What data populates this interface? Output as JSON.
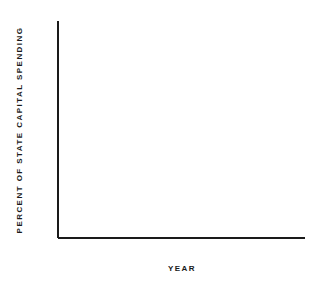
{
  "chart_data": {
    "type": "line",
    "title": "",
    "xlabel": "YEAR",
    "ylabel": "PERCENT OF STATE CAPITAL SPENDING",
    "x": [
      1981,
      1982,
      1983,
      1984,
      1985,
      1986,
      1987,
      1988
    ],
    "values": [
      27.0,
      22.1,
      20.5,
      14.3,
      16.2,
      17.1,
      23.3,
      23.6
    ],
    "series": [
      {
        "name": "Percent of state capital spending",
        "values": [
          27.0,
          22.1,
          20.5,
          14.3,
          16.2,
          17.1,
          23.3,
          23.6
        ]
      }
    ],
    "xlim": [
      1980,
      1988
    ],
    "ylim": [
      0,
      50
    ],
    "x_major_ticks": [
      1980,
      1982,
      1984,
      1986,
      1988
    ],
    "x_minor_ticks": [
      1981,
      1983,
      1985,
      1987
    ],
    "x_tick_labels": [
      "1980",
      "1982",
      "1984",
      "1986",
      "1988"
    ],
    "y_major_ticks": [
      0,
      10,
      20,
      30,
      40,
      50
    ],
    "y_minor_ticks": [
      5,
      15,
      25,
      35,
      45
    ],
    "y_tick_labels": [
      "0",
      "10",
      "20",
      "30",
      "40",
      "50"
    ],
    "grid": false,
    "legend": "none",
    "marker": "filled-square",
    "line_color": "#1a1a1a",
    "marker_color": "#1a1a1a",
    "background_color": "#ffffff"
  }
}
